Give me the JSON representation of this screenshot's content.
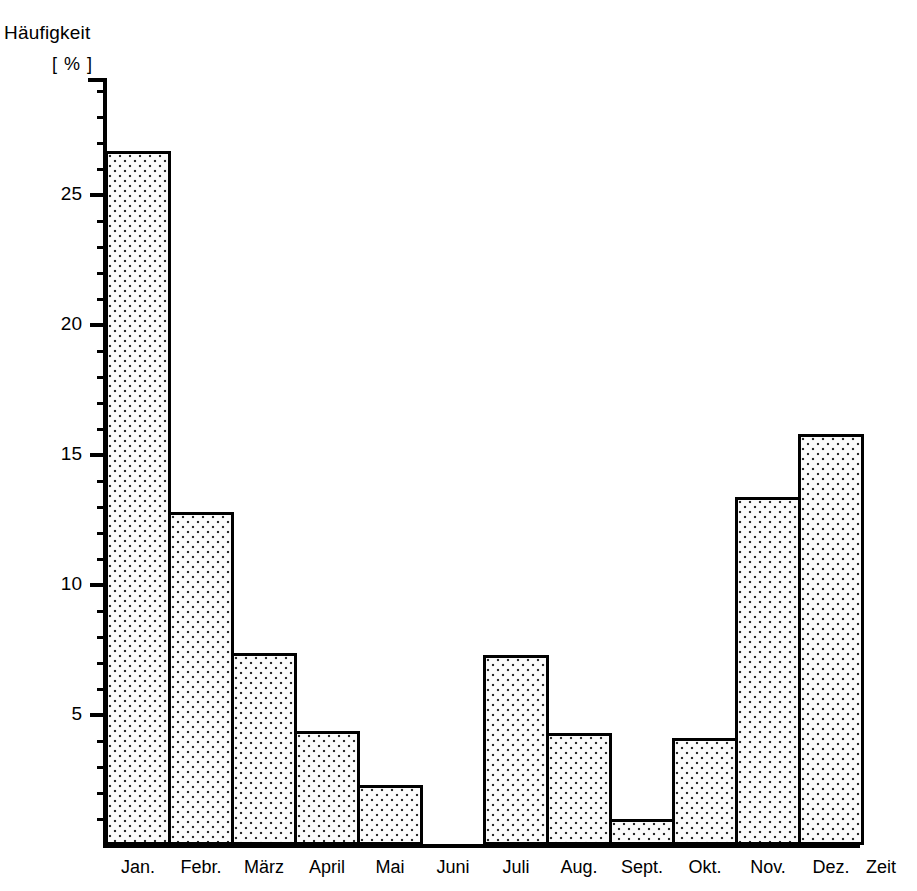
{
  "chart_data": {
    "type": "bar",
    "title": "",
    "ylabel": "Häufigkeit",
    "yunit": "[ % ]",
    "xlabel": "Zeit",
    "categories": [
      "Jan.",
      "Febr.",
      "März",
      "April",
      "Mai",
      "Juni",
      "Juli",
      "Aug.",
      "Sept.",
      "Okt.",
      "Nov.",
      "Dez."
    ],
    "values": [
      26.7,
      12.8,
      7.4,
      4.4,
      2.3,
      0,
      7.3,
      4.3,
      1.0,
      4.1,
      13.4,
      15.8
    ],
    "ylim": [
      0,
      29.5
    ],
    "y_major_ticks": [
      5,
      10,
      15,
      20,
      25
    ],
    "y_tick_labels": [
      "5",
      "10",
      "15",
      "20",
      "25"
    ],
    "y_minor_tick_step": 1,
    "grid": false,
    "legend": null,
    "bar_fill": "stippled-dot-pattern",
    "bar_edge_color": "#000000",
    "bar_face_color": "#fbfbfb",
    "axis_color": "#000000"
  }
}
